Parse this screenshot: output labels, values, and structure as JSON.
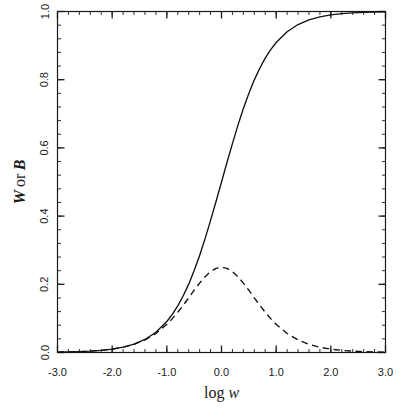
{
  "chart_data": {
    "type": "line",
    "title": "",
    "xlabel": "log w",
    "ylabel": "W or B",
    "xlabel_parts": {
      "roman": "log",
      "italic": "w"
    },
    "ylabel_parts": {
      "sym1": "W",
      "conj": "or",
      "sym2": "B"
    },
    "xlim": [
      -3.0,
      3.0
    ],
    "ylim": [
      0.0,
      1.0
    ],
    "grid": false,
    "legend": "none",
    "xticks": [
      -3.0,
      -2.0,
      -1.0,
      0.0,
      1.0,
      2.0,
      3.0
    ],
    "xtick_labels": [
      "-3.0",
      "-2.0",
      "-1.0",
      "0.0",
      "1.0",
      "2.0",
      "3.0"
    ],
    "yticks": [
      0.0,
      0.2,
      0.4,
      0.6,
      0.8,
      1.0
    ],
    "ytick_labels": [
      "0.0",
      "0.2",
      "0.4",
      "0.6",
      "0.8",
      "1.0"
    ],
    "x_minor_tick_interval": 0.2,
    "y_minor_tick_interval": 0.04,
    "series": [
      {
        "name": "W",
        "style": "solid",
        "color": "#111111",
        "description": "Saturation binding curve W = w/(1+w)",
        "x": [
          -3.0,
          -2.8,
          -2.6,
          -2.4,
          -2.2,
          -2.0,
          -1.8,
          -1.6,
          -1.4,
          -1.2,
          -1.0,
          -0.9,
          -0.8,
          -0.7,
          -0.6,
          -0.5,
          -0.4,
          -0.3,
          -0.2,
          -0.1,
          0.0,
          0.1,
          0.2,
          0.3,
          0.4,
          0.5,
          0.6,
          0.7,
          0.8,
          0.9,
          1.0,
          1.2,
          1.4,
          1.6,
          1.8,
          2.0,
          2.2,
          2.4,
          2.6,
          2.8,
          3.0
        ],
        "values": [
          0.001,
          0.0016,
          0.0025,
          0.004,
          0.0063,
          0.0099,
          0.0156,
          0.0245,
          0.0383,
          0.0593,
          0.0909,
          0.1118,
          0.1368,
          0.1663,
          0.2005,
          0.2403,
          0.2846,
          0.3339,
          0.3873,
          0.4429,
          0.5,
          0.5571,
          0.6127,
          0.6661,
          0.7154,
          0.7597,
          0.7995,
          0.8337,
          0.8632,
          0.8882,
          0.9091,
          0.9407,
          0.9617,
          0.9755,
          0.9842,
          0.9901,
          0.9937,
          0.996,
          0.9975,
          0.9984,
          0.999
        ]
      },
      {
        "name": "B",
        "style": "dashed",
        "color": "#111111",
        "description": "Bell-shaped buffering curve B = w/(1+w)^2",
        "peak_x": 0.0,
        "peak_y": 0.25,
        "x": [
          -3.0,
          -2.8,
          -2.6,
          -2.4,
          -2.2,
          -2.0,
          -1.8,
          -1.6,
          -1.4,
          -1.2,
          -1.0,
          -0.9,
          -0.8,
          -0.7,
          -0.6,
          -0.5,
          -0.4,
          -0.3,
          -0.2,
          -0.1,
          0.0,
          0.1,
          0.2,
          0.3,
          0.4,
          0.5,
          0.6,
          0.7,
          0.8,
          0.9,
          1.0,
          1.2,
          1.4,
          1.6,
          1.8,
          2.0,
          2.2,
          2.4,
          2.6,
          2.8,
          3.0
        ],
        "values": [
          0.001,
          0.0016,
          0.0025,
          0.004,
          0.0063,
          0.0098,
          0.0154,
          0.0239,
          0.0368,
          0.0558,
          0.0826,
          0.0993,
          0.1181,
          0.1386,
          0.1603,
          0.1826,
          0.2036,
          0.2224,
          0.2374,
          0.2467,
          0.25,
          0.2467,
          0.2374,
          0.2224,
          0.2036,
          0.1826,
          0.1603,
          0.1386,
          0.1181,
          0.0993,
          0.0826,
          0.0558,
          0.0368,
          0.0239,
          0.0154,
          0.0098,
          0.0063,
          0.004,
          0.0025,
          0.0016,
          0.001
        ]
      }
    ]
  }
}
